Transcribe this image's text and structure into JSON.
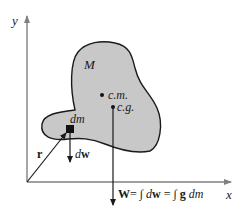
{
  "diagram": {
    "axes": {
      "x_label": "x",
      "y_label": "y"
    },
    "body_label": "M",
    "points": {
      "center_of_mass": "c.m.",
      "center_of_gravity": "c.g."
    },
    "element": {
      "mass_label": "dm",
      "weight_label_d": "d",
      "weight_label_w": "w"
    },
    "position_vector": "r",
    "equation": {
      "W": "W",
      "eq1": "= ∫ ",
      "d1": "d",
      "w1": "w",
      "eq2": " = ∫ ",
      "g": "g",
      "dm": " dm"
    },
    "colors": {
      "body_fill": "#c8c8c8",
      "line": "#1a1a1a"
    }
  }
}
